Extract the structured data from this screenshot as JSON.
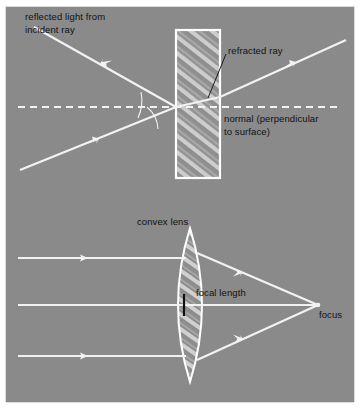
{
  "figure": {
    "background_color": "#8a8a8a",
    "ray_color": "#f2f2f2",
    "text_color": "#111111",
    "border_color": "#ffffff"
  },
  "diagram_top": {
    "name": "refraction-through-glass-block",
    "labels": {
      "reflected": "reflected light from\nincident ray",
      "refracted": "refracted ray",
      "normal": "normal (perpendicular\nto surface)"
    },
    "block": {
      "name": "glass-block",
      "shape": "rectangle",
      "hatched": true
    },
    "rays": [
      {
        "name": "incident-ray",
        "direction": "up-right",
        "arrow": true
      },
      {
        "name": "reflected-ray",
        "direction": "up-left",
        "arrow": true
      },
      {
        "name": "refracted-ray-in-block",
        "direction": "up-right",
        "arrow": false
      },
      {
        "name": "emergent-ray",
        "direction": "up-right",
        "arrow": true
      }
    ],
    "normal_line": {
      "name": "normal-line",
      "style": "dashed",
      "orientation": "horizontal"
    },
    "angle_arcs": 2
  },
  "diagram_bottom": {
    "name": "convex-lens-focusing",
    "labels": {
      "lens": "convex lens",
      "focal_length": "focal length",
      "focus": "focus"
    },
    "lens": {
      "name": "convex-lens",
      "shape": "biconvex",
      "hatched": true
    },
    "incoming_rays": 3,
    "converging_rays": 2,
    "axis": {
      "name": "optical-axis",
      "orientation": "horizontal"
    },
    "focus_point": {
      "name": "focus-point"
    },
    "center_tick": {
      "name": "lens-center-tick",
      "color": "#101010"
    }
  }
}
